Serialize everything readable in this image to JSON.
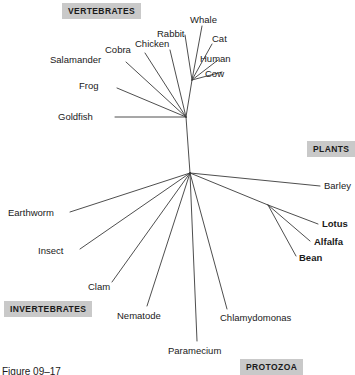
{
  "figure": {
    "caption": "Figure 09–17",
    "caption_x": 2,
    "caption_y": 366,
    "background": "#ffffff",
    "line_color": "#3a3a3a",
    "text_color": "#1a1a1a",
    "group_badge_bg": "#c9c9c9"
  },
  "chart_data": {
    "type": "diagram",
    "subtype": "unrooted-phylogenetic-tree",
    "title": "Figure 09–17",
    "nodes": [
      {
        "id": "center",
        "label": "",
        "x": 190,
        "y": 173,
        "kind": "internal"
      },
      {
        "id": "vertebrate_node",
        "label": "",
        "x": 186,
        "y": 117,
        "kind": "internal"
      },
      {
        "id": "mammal_node",
        "label": "",
        "x": 192,
        "y": 80,
        "kind": "internal"
      },
      {
        "id": "legume_node",
        "label": "",
        "x": 268,
        "y": 205,
        "kind": "internal"
      }
    ],
    "edges": [
      {
        "from": "center",
        "to": "vertebrate_node"
      },
      {
        "from": "vertebrate_node",
        "to": "mammal_node"
      },
      {
        "from": "vertebrate_node",
        "to": "Goldfish"
      },
      {
        "from": "vertebrate_node",
        "to": "Frog"
      },
      {
        "from": "vertebrate_node",
        "to": "Salamander"
      },
      {
        "from": "vertebrate_node",
        "to": "Cobra"
      },
      {
        "from": "vertebrate_node",
        "to": "Chicken"
      },
      {
        "from": "mammal_node",
        "to": "Rabbit"
      },
      {
        "from": "mammal_node",
        "to": "Whale"
      },
      {
        "from": "mammal_node",
        "to": "Cat"
      },
      {
        "from": "mammal_node",
        "to": "Human"
      },
      {
        "from": "mammal_node",
        "to": "Cow"
      },
      {
        "from": "center",
        "to": "Earthworm"
      },
      {
        "from": "center",
        "to": "Insect"
      },
      {
        "from": "center",
        "to": "Clam"
      },
      {
        "from": "center",
        "to": "Nematode"
      },
      {
        "from": "center",
        "to": "Paramecium"
      },
      {
        "from": "center",
        "to": "Chlamydomonas"
      },
      {
        "from": "center",
        "to": "Barley"
      },
      {
        "from": "center",
        "to": "legume_node"
      },
      {
        "from": "legume_node",
        "to": "Lotus"
      },
      {
        "from": "legume_node",
        "to": "Alfalfa"
      },
      {
        "from": "legume_node",
        "to": "Bean"
      }
    ],
    "branches": [
      {
        "name": "center-to-vertebrates",
        "x1": 190,
        "y1": 173,
        "x2": 186,
        "y2": 117
      },
      {
        "name": "vertebrates-to-mammals",
        "x1": 186,
        "y1": 117,
        "x2": 192,
        "y2": 80
      },
      {
        "name": "goldfish-branch",
        "x1": 186,
        "y1": 117,
        "x2": 115,
        "y2": 117
      },
      {
        "name": "frog-branch",
        "x1": 186,
        "y1": 117,
        "x2": 117,
        "y2": 88
      },
      {
        "name": "salamander-branch",
        "x1": 186,
        "y1": 117,
        "x2": 126,
        "y2": 62
      },
      {
        "name": "cobra-branch",
        "x1": 186,
        "y1": 117,
        "x2": 145,
        "y2": 53
      },
      {
        "name": "chicken-branch",
        "x1": 186,
        "y1": 117,
        "x2": 170,
        "y2": 50
      },
      {
        "name": "rabbit-branch",
        "x1": 192,
        "y1": 80,
        "x2": 185,
        "y2": 35
      },
      {
        "name": "whale-branch",
        "x1": 192,
        "y1": 80,
        "x2": 202,
        "y2": 26
      },
      {
        "name": "cat-branch",
        "x1": 192,
        "y1": 80,
        "x2": 212,
        "y2": 44
      },
      {
        "name": "human-branch",
        "x1": 192,
        "y1": 80,
        "x2": 218,
        "y2": 60
      },
      {
        "name": "cow-branch",
        "x1": 192,
        "y1": 80,
        "x2": 222,
        "y2": 72
      },
      {
        "name": "earthworm-branch",
        "x1": 190,
        "y1": 173,
        "x2": 70,
        "y2": 212
      },
      {
        "name": "insect-branch",
        "x1": 190,
        "y1": 173,
        "x2": 80,
        "y2": 249
      },
      {
        "name": "clam-branch",
        "x1": 190,
        "y1": 173,
        "x2": 112,
        "y2": 282
      },
      {
        "name": "nematode-branch",
        "x1": 190,
        "y1": 173,
        "x2": 147,
        "y2": 306
      },
      {
        "name": "paramecium-branch",
        "x1": 190,
        "y1": 173,
        "x2": 197,
        "y2": 341
      },
      {
        "name": "chlamydomonas-branch",
        "x1": 190,
        "y1": 173,
        "x2": 227,
        "y2": 309
      },
      {
        "name": "barley-branch",
        "x1": 190,
        "y1": 173,
        "x2": 320,
        "y2": 186
      },
      {
        "name": "center-to-legumes",
        "x1": 190,
        "y1": 173,
        "x2": 268,
        "y2": 205
      },
      {
        "name": "lotus-branch",
        "x1": 268,
        "y1": 205,
        "x2": 318,
        "y2": 224
      },
      {
        "name": "alfalfa-branch",
        "x1": 268,
        "y1": 205,
        "x2": 310,
        "y2": 241
      },
      {
        "name": "bean-branch",
        "x1": 268,
        "y1": 205,
        "x2": 296,
        "y2": 256
      }
    ],
    "taxa": [
      {
        "name": "Whale",
        "group": "vertebrates",
        "bold": false,
        "x": 190,
        "y": 14
      },
      {
        "name": "Rabbit",
        "group": "vertebrates",
        "bold": false,
        "x": 157,
        "y": 28
      },
      {
        "name": "Cat",
        "group": "vertebrates",
        "bold": false,
        "x": 212,
        "y": 33
      },
      {
        "name": "Chicken",
        "group": "vertebrates",
        "bold": false,
        "x": 135,
        "y": 38
      },
      {
        "name": "Cobra",
        "group": "vertebrates",
        "bold": false,
        "x": 105,
        "y": 44
      },
      {
        "name": "Human",
        "group": "vertebrates",
        "bold": false,
        "x": 200,
        "y": 53
      },
      {
        "name": "Salamander",
        "group": "vertebrates",
        "bold": false,
        "x": 50,
        "y": 54
      },
      {
        "name": "Cow",
        "group": "vertebrates",
        "bold": false,
        "x": 205,
        "y": 68
      },
      {
        "name": "Frog",
        "group": "vertebrates",
        "bold": false,
        "x": 79,
        "y": 80
      },
      {
        "name": "Goldfish",
        "group": "vertebrates",
        "bold": false,
        "x": 58,
        "y": 111
      },
      {
        "name": "Barley",
        "group": "plants",
        "bold": false,
        "x": 324,
        "y": 180
      },
      {
        "name": "Lotus",
        "group": "plants",
        "bold": true,
        "x": 322,
        "y": 218
      },
      {
        "name": "Alfalfa",
        "group": "plants",
        "bold": true,
        "x": 314,
        "y": 236
      },
      {
        "name": "Bean",
        "group": "plants",
        "bold": true,
        "x": 299,
        "y": 252
      },
      {
        "name": "Earthworm",
        "group": "invertebrates",
        "bold": false,
        "x": 8,
        "y": 207
      },
      {
        "name": "Insect",
        "group": "invertebrates",
        "bold": false,
        "x": 38,
        "y": 245
      },
      {
        "name": "Clam",
        "group": "invertebrates",
        "bold": false,
        "x": 88,
        "y": 281
      },
      {
        "name": "Nematode",
        "group": "invertebrates",
        "bold": false,
        "x": 117,
        "y": 310
      },
      {
        "name": "Chlamydomonas",
        "group": "protozoa",
        "bold": false,
        "x": 220,
        "y": 312
      },
      {
        "name": "Paramecium",
        "group": "protozoa",
        "bold": false,
        "x": 168,
        "y": 345
      }
    ],
    "groups": [
      {
        "name": "VERTEBRATES",
        "x": 62,
        "y": 3
      },
      {
        "name": "PLANTS",
        "x": 307,
        "y": 141
      },
      {
        "name": "INVERTEBRATES",
        "x": 4,
        "y": 301
      },
      {
        "name": "PROTOZOA",
        "x": 240,
        "y": 359
      }
    ]
  }
}
